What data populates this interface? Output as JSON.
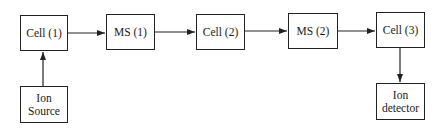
{
  "diagram": {
    "nodes": [
      {
        "id": "cell1",
        "label": "Cell (1)",
        "x": 20,
        "y": 15,
        "w": 48,
        "h": 36
      },
      {
        "id": "ms1",
        "label": "MS (1)",
        "x": 106,
        "y": 14,
        "w": 49,
        "h": 36
      },
      {
        "id": "cell2",
        "label": "Cell (2)",
        "x": 196,
        "y": 14,
        "w": 49,
        "h": 36
      },
      {
        "id": "ms2",
        "label": "MS (2)",
        "x": 288,
        "y": 13,
        "w": 50,
        "h": 36
      },
      {
        "id": "cell3",
        "label": "Cell (3)",
        "x": 376,
        "y": 12,
        "w": 49,
        "h": 36
      },
      {
        "id": "ion_source",
        "label": "Ion\nSource",
        "x": 20,
        "y": 86,
        "w": 48,
        "h": 37
      },
      {
        "id": "ion_detector",
        "label": "Ion\ndetector",
        "x": 376,
        "y": 83,
        "w": 49,
        "h": 37
      }
    ],
    "edges": [
      {
        "from": "ion_source",
        "to": "cell1"
      },
      {
        "from": "cell1",
        "to": "ms1"
      },
      {
        "from": "ms1",
        "to": "cell2"
      },
      {
        "from": "cell2",
        "to": "ms2"
      },
      {
        "from": "ms2",
        "to": "cell3"
      },
      {
        "from": "cell3",
        "to": "ion_detector"
      }
    ],
    "line_color": "#222222"
  }
}
